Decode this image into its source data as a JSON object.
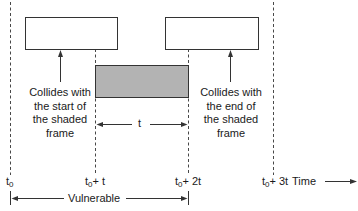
{
  "diagram": {
    "type": "timing-diagram",
    "colors": {
      "line": "#333333",
      "shaded_frame_fill": "#b3b3b3",
      "frame_fill": "#ffffff"
    },
    "frames": [
      {
        "id": "earlier-frame",
        "shaded": false
      },
      {
        "id": "shaded-frame",
        "shaded": true
      },
      {
        "id": "later-frame",
        "shaded": false
      }
    ],
    "annotations": {
      "left_caption": [
        "Collides with",
        "the start of",
        "the shaded",
        "frame"
      ],
      "right_caption": [
        "Collides with",
        "the end of",
        "the shaded",
        "frame"
      ],
      "duration_label": "t"
    },
    "axis": {
      "ticks": [
        {
          "base": "t",
          "sub": "0",
          "suffix": ""
        },
        {
          "base": "t",
          "sub": "0",
          "suffix": "+ t"
        },
        {
          "base": "t",
          "sub": "0",
          "suffix": "+ 2t"
        },
        {
          "base": "t",
          "sub": "0",
          "suffix": "+ 3t"
        }
      ],
      "time_label": "Time",
      "vulnerable_label": "Vulnerable"
    }
  }
}
